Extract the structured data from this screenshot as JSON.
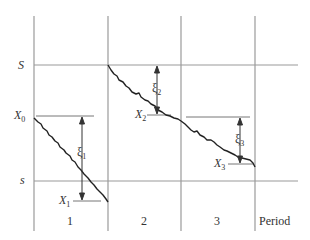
{
  "diagram": {
    "type": "inventory-period-diagram",
    "y_labels": {
      "upper": "S",
      "lower": "s",
      "x0": "X",
      "x0_sub": "0"
    },
    "levels": [
      {
        "name": "X",
        "sub": "1"
      },
      {
        "name": "X",
        "sub": "2"
      },
      {
        "name": "X",
        "sub": "3"
      }
    ],
    "demands": [
      {
        "name": "ξ",
        "sub": "1"
      },
      {
        "name": "ξ",
        "sub": "2"
      },
      {
        "name": "ξ",
        "sub": "3"
      }
    ],
    "periods": [
      "1",
      "2",
      "3"
    ],
    "period_axis_label": "Period",
    "colors": {
      "grid": "#999999",
      "path": "#222222",
      "text": "#333333"
    }
  }
}
